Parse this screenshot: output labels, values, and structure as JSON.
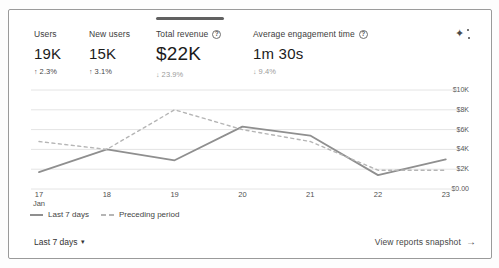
{
  "ui": {
    "sparkle_glyph": "✦",
    "help_glyph": "?",
    "caret_glyph": "▾",
    "arrow_right_glyph": "→"
  },
  "metrics": [
    {
      "label": "Users",
      "value": "19K",
      "arrow": "↑",
      "delta": "2.3%",
      "direction": "up"
    },
    {
      "label": "New users",
      "value": "15K",
      "arrow": "↑",
      "delta": "3.1%",
      "direction": "up"
    },
    {
      "label": "Total revenue",
      "value": "$22K",
      "arrow": "↓",
      "delta": "23.9%",
      "direction": "down",
      "selected": true
    },
    {
      "label": "Average engagement time",
      "value": "1m 30s",
      "arrow": "↓",
      "delta": "9.4%",
      "direction": "down"
    }
  ],
  "legend": [
    {
      "name": "Last 7 days",
      "style": "solid"
    },
    {
      "name": "Preceding period",
      "style": "dashed"
    }
  ],
  "footer": {
    "date_range": "Last 7 days",
    "link": "View reports snapshot"
  },
  "chart_data": {
    "type": "line",
    "x_labels": [
      "17",
      "18",
      "19",
      "20",
      "21",
      "22",
      "23"
    ],
    "month_label": "Jan",
    "xlabel": "",
    "ylabel": "",
    "ylim": [
      0,
      10000
    ],
    "grid": true,
    "legend_position": "bottom",
    "y_ticks": [
      {
        "label": "$0.00",
        "value": 0
      },
      {
        "label": "$2K",
        "value": 2000
      },
      {
        "label": "$4K",
        "value": 4000
      },
      {
        "label": "$6K",
        "value": 6000
      },
      {
        "label": "$8K",
        "value": 8000
      },
      {
        "label": "$10K",
        "value": 10000
      }
    ],
    "series": [
      {
        "name": "Last 7 days",
        "style": "solid",
        "values": [
          1700,
          4000,
          2900,
          6300,
          5400,
          1400,
          3000
        ]
      },
      {
        "name": "Preceding period",
        "style": "dashed",
        "values": [
          4800,
          4000,
          8000,
          6000,
          4800,
          1900,
          1900
        ]
      }
    ],
    "colors": {
      "solid": "#8f8f8f",
      "dashed": "#b5b5b5",
      "grid": "#e4e4e4"
    }
  }
}
